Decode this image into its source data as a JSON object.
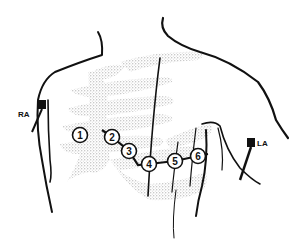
{
  "diagram": {
    "limb_electrodes": [
      {
        "id": "RA",
        "label": "RA",
        "x": 42,
        "y": 105,
        "label_x": 18,
        "label_y": 117
      },
      {
        "id": "LA",
        "label": "LA",
        "x": 251,
        "y": 143,
        "label_x": 256,
        "label_y": 146
      }
    ],
    "chest_electrodes": [
      {
        "id": "V1",
        "label": "1",
        "x": 80,
        "y": 135
      },
      {
        "id": "V2",
        "label": "2",
        "x": 112,
        "y": 137
      },
      {
        "id": "V3",
        "label": "3",
        "x": 129,
        "y": 151
      },
      {
        "id": "V4",
        "label": "4",
        "x": 149,
        "y": 164
      },
      {
        "id": "V5",
        "label": "5",
        "x": 175,
        "y": 161
      },
      {
        "id": "V6",
        "label": "6",
        "x": 198,
        "y": 156
      }
    ],
    "colors": {
      "ink": "#111111",
      "stipple": "#9a9a9a",
      "background": "#ffffff"
    }
  }
}
